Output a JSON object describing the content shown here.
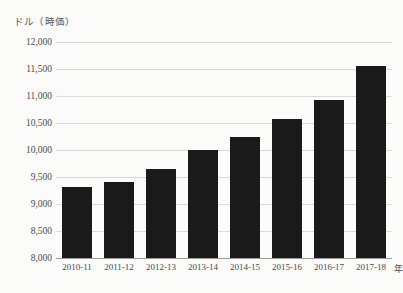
{
  "chart_data": {
    "type": "bar",
    "title": "",
    "subtitle": "",
    "xlabel": "年",
    "ylabel": "ドル（時価）",
    "categories": [
      "2010-11",
      "2011-12",
      "2012-13",
      "2013-14",
      "2014-15",
      "2015-16",
      "2016-17",
      "2017-18"
    ],
    "values": [
      9320,
      9400,
      9650,
      10000,
      10250,
      10570,
      10920,
      11550
    ],
    "ylim": [
      8000,
      12000
    ],
    "ytick_step": 500,
    "ytick_labels": [
      "12,000",
      "11,500",
      "11,000",
      "10,500",
      "10,000",
      "9,500",
      "9,000",
      "8,500",
      "8,000"
    ],
    "ytick_values": [
      12000,
      11500,
      11000,
      10500,
      10000,
      9500,
      9000,
      8500,
      8000
    ],
    "grid": "horizontal",
    "legend": "none",
    "bar_color": "#1a1a1a",
    "grid_color": "#d9d9d9",
    "axis_color": "#9a9a9a",
    "background_color": "#fbfbfa"
  }
}
